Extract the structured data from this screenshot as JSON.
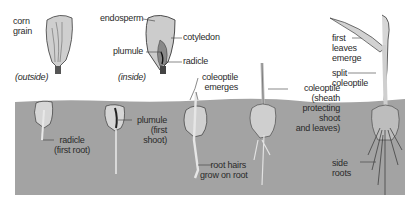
{
  "diagram": {
    "colors": {
      "soil": "#a3a3a3",
      "seed_outline": "#3a3a3a",
      "seed_fill": "#d0d0d0",
      "endosperm": "#c4c4c4",
      "text": "#2a2a2a",
      "background": "#ffffff"
    },
    "labels": {
      "corn_grain": [
        "corn",
        "grain"
      ],
      "outside": "(outside)",
      "inside": "(inside)",
      "endosperm": "endosperm",
      "cotyledon": "cotyledon",
      "plumule": "plumule",
      "radicle": "radicle",
      "coleoptile_emerges": [
        "coleoptile",
        "emerges"
      ],
      "coleoptile_sheath": [
        "coleoptile",
        "(sheath",
        "protecting",
        "shoot",
        "and leaves)"
      ],
      "first_leaves": [
        "first",
        "leaves",
        "emerge"
      ],
      "split_coleoptile": [
        "split",
        "coleoptile"
      ],
      "radicle_first_root": [
        "radicle",
        "(first root)"
      ],
      "plumule_first_shoot": [
        "plumule",
        "(first",
        "shoot)"
      ],
      "root_hairs": [
        "root hairs",
        "grow on root"
      ],
      "side_roots": [
        "side",
        "roots"
      ]
    }
  }
}
